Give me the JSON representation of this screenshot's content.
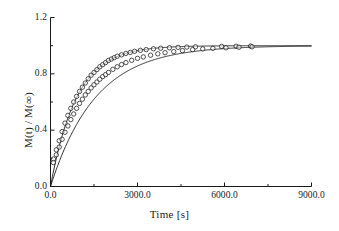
{
  "chart_data": {
    "type": "scatter",
    "title": "",
    "xlabel": "Time [s]",
    "ylabel": "M(t) / M(∞)",
    "xlim": [
      0,
      9000
    ],
    "ylim": [
      0,
      1.2
    ],
    "grid": false,
    "legend_position": "none",
    "xticks": [
      "0.0",
      "3000.0",
      "6000.0",
      "9000.0"
    ],
    "xtick_values": [
      0,
      3000,
      6000,
      9000
    ],
    "xminor_ticks": [
      1500,
      4500,
      7500
    ],
    "yticks": [
      "0.0",
      "0.4",
      "0.8",
      "1.2"
    ],
    "ytick_values": [
      0,
      0.4,
      0.8,
      1.2
    ],
    "yminor_ticks": [
      0.2,
      0.6,
      1.0
    ],
    "marker": "open-circle",
    "marker_size": 3,
    "line_color": "#1a1a1a",
    "marker_edge_color": "#1a1a1a",
    "series": [
      {
        "name": "Fast recovery",
        "fit": "exponential-saturation",
        "tau": 900,
        "amplitude": 1.0,
        "x": [
          100,
          200,
          300,
          400,
          500,
          600,
          700,
          800,
          900,
          1000,
          1100,
          1200,
          1300,
          1400,
          1500,
          1600,
          1700,
          1800,
          1900,
          2000,
          2100,
          2200,
          2300,
          2450,
          2600,
          2750,
          2900,
          3100,
          3300,
          3550,
          3800,
          4100,
          4400,
          4700,
          5000,
          5900,
          6400,
          6900
        ],
        "y": [
          0.195,
          0.26,
          0.325,
          0.39,
          0.45,
          0.505,
          0.555,
          0.6,
          0.64,
          0.675,
          0.705,
          0.735,
          0.765,
          0.79,
          0.81,
          0.83,
          0.85,
          0.865,
          0.88,
          0.895,
          0.905,
          0.915,
          0.925,
          0.935,
          0.945,
          0.952,
          0.96,
          0.967,
          0.972,
          0.978,
          0.982,
          0.985,
          0.988,
          0.99,
          0.992,
          0.995,
          0.996,
          0.997
        ]
      },
      {
        "name": "Slow recovery",
        "fit": "exponential-saturation",
        "tau": 1550,
        "amplitude": 1.0,
        "x": [
          100,
          200,
          300,
          400,
          500,
          600,
          700,
          800,
          900,
          1000,
          1100,
          1200,
          1300,
          1400,
          1500,
          1600,
          1700,
          1800,
          1900,
          2000,
          2150,
          2300,
          2450,
          2600,
          2800,
          3000,
          3200,
          3450,
          3700,
          3950,
          4250,
          4550,
          4900,
          5250,
          5600,
          6050,
          6500,
          6950
        ],
        "y": [
          0.17,
          0.225,
          0.28,
          0.335,
          0.385,
          0.43,
          0.475,
          0.515,
          0.555,
          0.59,
          0.62,
          0.65,
          0.675,
          0.7,
          0.722,
          0.742,
          0.762,
          0.78,
          0.795,
          0.81,
          0.832,
          0.85,
          0.866,
          0.88,
          0.896,
          0.91,
          0.92,
          0.932,
          0.942,
          0.95,
          0.958,
          0.965,
          0.972,
          0.977,
          0.981,
          0.985,
          0.989,
          0.992
        ]
      }
    ]
  },
  "axes": {
    "x_title": "Time [s]",
    "y_title": "M(t) / M(∞)"
  }
}
